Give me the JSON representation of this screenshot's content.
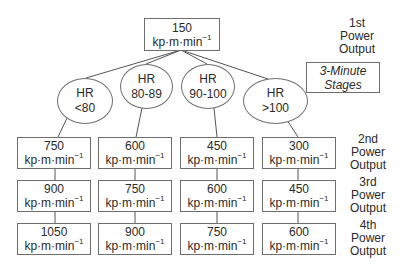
{
  "diagram": {
    "start": {
      "value": "150",
      "unit_base": "kp·m·min",
      "unit_exp": "−1",
      "label_lines": [
        "1st",
        "Power",
        "Output"
      ]
    },
    "stage_note": [
      "3-Minute",
      "Stages"
    ],
    "branches": [
      {
        "hr_label": "HR",
        "hr_range": "<80",
        "outputs": [
          "750",
          "900",
          "1050"
        ]
      },
      {
        "hr_label": "HR",
        "hr_range": "80-89",
        "outputs": [
          "600",
          "750",
          "900"
        ]
      },
      {
        "hr_label": "HR",
        "hr_range": "90-100",
        "outputs": [
          "450",
          "600",
          "750"
        ]
      },
      {
        "hr_label": "HR",
        "hr_range": ">100",
        "outputs": [
          "300",
          "450",
          "600"
        ]
      }
    ],
    "row_labels": [
      [
        "2nd",
        "Power",
        "Output"
      ],
      [
        "3rd",
        "Power",
        "Output"
      ],
      [
        "4th",
        "Power",
        "Output"
      ]
    ],
    "colors": {
      "border": "#6e6e6e",
      "text": "#2a2a2a",
      "background": "#ffffff"
    }
  }
}
